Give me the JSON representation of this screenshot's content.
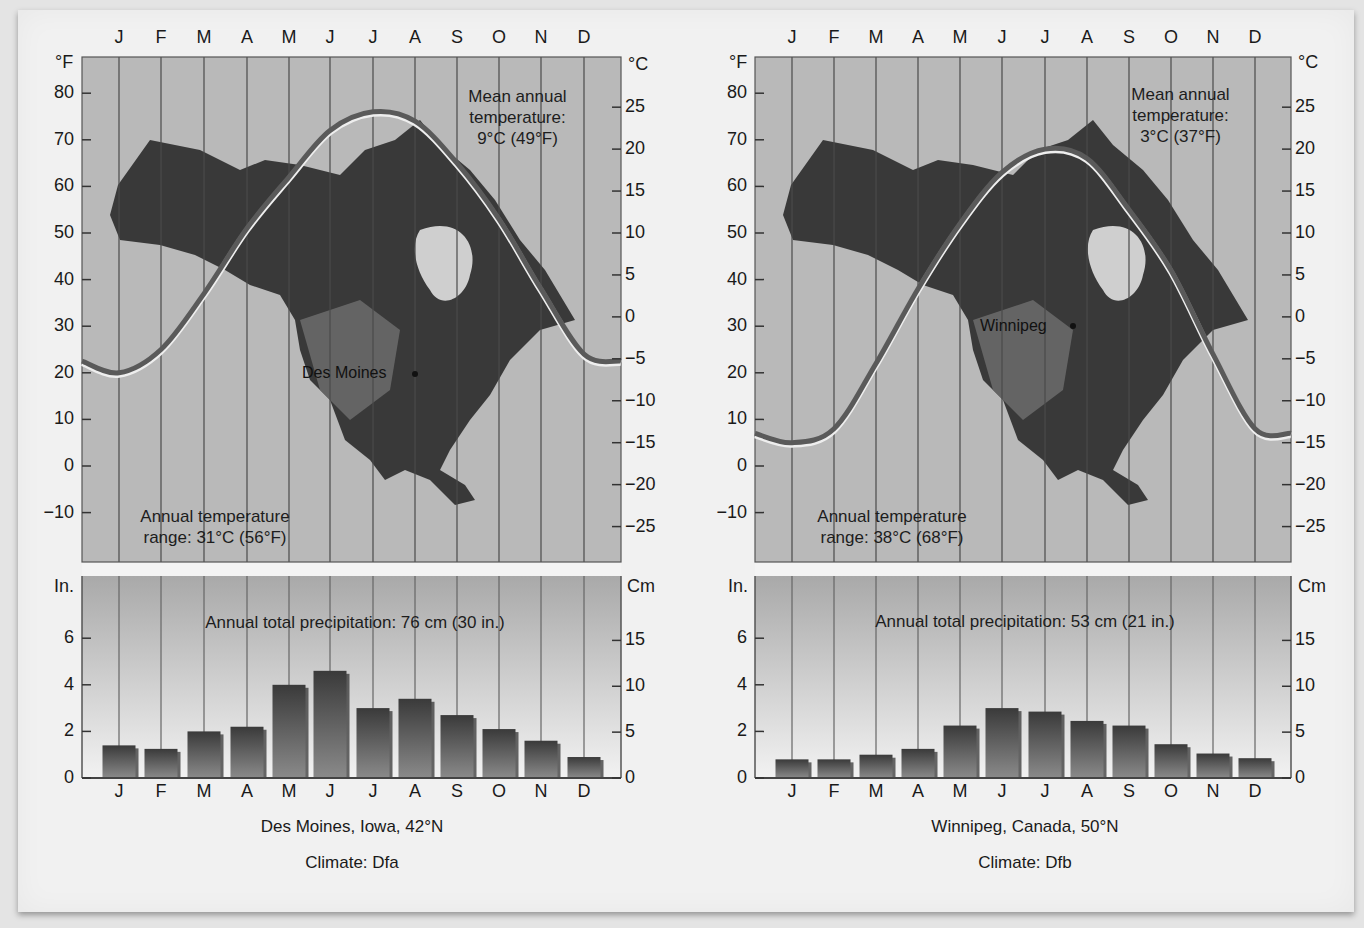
{
  "months": [
    "J",
    "F",
    "M",
    "A",
    "M",
    "J",
    "J",
    "A",
    "S",
    "O",
    "N",
    "D"
  ],
  "colors": {
    "plot_bg": "#b9b9b9",
    "precip_bg_top": "#a9a9a9",
    "precip_bg_bottom": "#f2f2f2",
    "curve": "#5a5a5a",
    "curve_highlight": "#eeeeee",
    "bar_light": "#8a8a8a",
    "bar_dark": "#3a3a3a",
    "land_dark": "#2b2b2b",
    "land_mid": "#6f6f6f",
    "gridline": "#4a4a4a",
    "separator": "#f4f4f4"
  },
  "axes": {
    "temp_left_unit": "°F",
    "temp_right_unit": "°C",
    "precip_left_unit": "In.",
    "precip_right_unit": "Cm",
    "temp_f_ticks": [
      "80",
      "70",
      "60",
      "50",
      "40",
      "30",
      "20",
      "10",
      "0",
      "−10"
    ],
    "temp_c_ticks": [
      "25",
      "20",
      "15",
      "10",
      "5",
      "0",
      "−5",
      "−10",
      "−15",
      "−20",
      "−25"
    ],
    "precip_in_ticks": [
      "6",
      "4",
      "2",
      "0"
    ],
    "precip_cm_ticks": [
      "15",
      "10",
      "5",
      "0"
    ]
  },
  "panels": [
    {
      "station": "Des Moines",
      "caption_location": "Des Moines, Iowa, 42°N",
      "caption_climate": "Climate: Dfa",
      "mean_annual_line1": "Mean annual",
      "mean_annual_line2": "temperature:",
      "mean_annual_line3": "9°C (49°F)",
      "range_line1": "Annual temperature",
      "range_line2": "range: 31°C (56°F)",
      "precip_total": "Annual total precipitation: 76 cm (30 in.)"
    },
    {
      "station": "Winnipeg",
      "caption_location": "Winnipeg, Canada, 50°N",
      "caption_climate": "Climate: Dfb",
      "mean_annual_line1": "Mean annual",
      "mean_annual_line2": "temperature:",
      "mean_annual_line3": "3°C (37°F)",
      "range_line1": "Annual temperature",
      "range_line2": "range: 38°C (68°F)",
      "precip_total": "Annual total precipitation: 53 cm (21 in.)"
    }
  ],
  "chart_data": [
    {
      "type": "line",
      "title": "Des Moines, Iowa, 42°N — Monthly temperature (Climate: Dfa)",
      "x": [
        "J",
        "F",
        "M",
        "A",
        "M",
        "J",
        "J",
        "A",
        "S",
        "O",
        "N",
        "D"
      ],
      "series": [
        {
          "name": "Mean monthly temperature (°F)",
          "values": [
            20,
            25,
            37,
            51,
            62,
            72,
            76,
            74,
            65,
            53,
            38,
            24
          ]
        }
      ],
      "xlabel": "Month",
      "ylabel": "°F (left) / °C (right)",
      "ylim": [
        -18,
        88
      ],
      "y2lim_c": [
        -28,
        31
      ],
      "annotations": [
        "Mean annual temperature: 9°C (49°F)",
        "Annual temperature range: 31°C (56°F)",
        "Des Moines"
      ],
      "grid": "vertical lines at each month"
    },
    {
      "type": "bar",
      "title": "Des Moines, Iowa, 42°N — Monthly precipitation",
      "categories": [
        "J",
        "F",
        "M",
        "A",
        "M",
        "J",
        "J",
        "A",
        "S",
        "O",
        "N",
        "D"
      ],
      "values": [
        1.4,
        1.25,
        2.0,
        2.2,
        4.0,
        4.6,
        3.0,
        3.4,
        2.7,
        2.1,
        1.6,
        0.9
      ],
      "xlabel": "Month",
      "ylabel": "In. (left) / Cm (right)",
      "ylim": [
        0,
        7.8
      ],
      "annotations": [
        "Annual total precipitation: 76 cm (30 in.)"
      ]
    },
    {
      "type": "line",
      "title": "Winnipeg, Canada, 50°N — Monthly temperature (Climate: Dfb)",
      "x": [
        "J",
        "F",
        "M",
        "A",
        "M",
        "J",
        "J",
        "A",
        "S",
        "O",
        "N",
        "D"
      ],
      "series": [
        {
          "name": "Mean monthly temperature (°F)",
          "values": [
            5,
            8,
            22,
            38,
            52,
            63,
            68,
            66,
            55,
            42,
            24,
            8
          ]
        }
      ],
      "xlabel": "Month",
      "ylabel": "°F (left) / °C (right)",
      "ylim": [
        -18,
        88
      ],
      "y2lim_c": [
        -28,
        31
      ],
      "annotations": [
        "Mean annual temperature: 3°C (37°F)",
        "Annual temperature range: 38°C (68°F)",
        "Winnipeg"
      ],
      "grid": "vertical lines at each month"
    },
    {
      "type": "bar",
      "title": "Winnipeg, Canada, 50°N — Monthly precipitation",
      "categories": [
        "J",
        "F",
        "M",
        "A",
        "M",
        "J",
        "J",
        "A",
        "S",
        "O",
        "N",
        "D"
      ],
      "values": [
        0.8,
        0.8,
        1.0,
        1.25,
        2.25,
        3.0,
        2.85,
        2.45,
        2.25,
        1.45,
        1.05,
        0.85
      ],
      "xlabel": "Month",
      "ylabel": "In. (left) / Cm (right)",
      "ylim": [
        0,
        7.8
      ],
      "annotations": [
        "Annual total precipitation: 53 cm (21 in.)"
      ]
    }
  ]
}
